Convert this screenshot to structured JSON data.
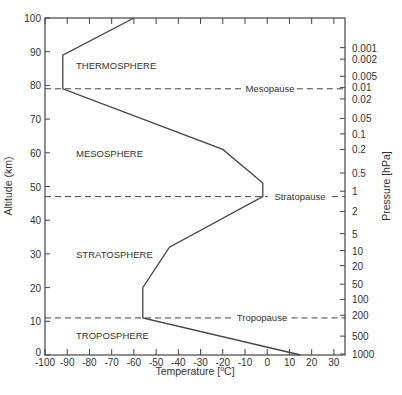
{
  "chart_data": {
    "type": "line",
    "title": "",
    "xlabel": "Temperature [°C]",
    "ylabel": "Altitude (km)",
    "y2label": "Pressure [hPa]",
    "xlim": [
      -100,
      35
    ],
    "ylim": [
      0,
      100
    ],
    "xticks": [
      -100,
      -90,
      -80,
      -70,
      -60,
      -50,
      -40,
      -30,
      -20,
      -10,
      0,
      10,
      20,
      30
    ],
    "yticks": [
      0,
      10,
      20,
      30,
      40,
      50,
      60,
      70,
      80,
      90,
      100
    ],
    "pressure_ticks": [
      {
        "label": "0.001",
        "alt": 91.2
      },
      {
        "label": "0.002",
        "alt": 87.8
      },
      {
        "label": "0.005",
        "alt": 82.7
      },
      {
        "label": "0.01",
        "alt": 79.4
      },
      {
        "label": "0.02",
        "alt": 76.0
      },
      {
        "label": "0.05",
        "alt": 70.2
      },
      {
        "label": "0.1",
        "alt": 65.6
      },
      {
        "label": "0.2",
        "alt": 61.0
      },
      {
        "label": "0.5",
        "alt": 54.0
      },
      {
        "label": "1",
        "alt": 48.6
      },
      {
        "label": "2",
        "alt": 42.6
      },
      {
        "label": "5",
        "alt": 36.0
      },
      {
        "label": "10",
        "alt": 31.0
      },
      {
        "label": "20",
        "alt": 26.5
      },
      {
        "label": "50",
        "alt": 21.0
      },
      {
        "label": "100",
        "alt": 16.5
      },
      {
        "label": "200",
        "alt": 11.8
      },
      {
        "label": "500",
        "alt": 5.6
      },
      {
        "label": "1000",
        "alt": 0.3
      }
    ],
    "series": [
      {
        "name": "Temperature profile",
        "points": [
          [
            15,
            0
          ],
          [
            -56,
            11
          ],
          [
            -56,
            20
          ],
          [
            -44,
            32
          ],
          [
            -2,
            47
          ],
          [
            -2,
            51
          ],
          [
            -20,
            61
          ],
          [
            -92,
            79
          ],
          [
            -92,
            89
          ],
          [
            -60,
            100
          ]
        ]
      }
    ],
    "boundaries": [
      {
        "label": "Mesopause",
        "alt": 79
      },
      {
        "label": "Stratopause",
        "alt": 47
      },
      {
        "label": "Tropopause",
        "alt": 11
      }
    ],
    "layers": [
      {
        "label": "THERMOSPHERE",
        "alt": 86
      },
      {
        "label": "MESOSPHERE",
        "alt": 60
      },
      {
        "label": "STRATOSPHERE",
        "alt": 30
      },
      {
        "label": "TROPOSPHERE",
        "alt": 6
      }
    ],
    "grid": false,
    "legend": "none"
  }
}
